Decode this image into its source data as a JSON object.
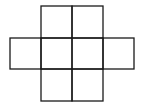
{
  "diagram": {
    "type": "grid-net",
    "stroke_color": "#1a1a1a",
    "background": "#ffffff",
    "cells": [
      {
        "row": 0,
        "col": 1
      },
      {
        "row": 0,
        "col": 2
      },
      {
        "row": 1,
        "col": 0
      },
      {
        "row": 1,
        "col": 1
      },
      {
        "row": 1,
        "col": 2
      },
      {
        "row": 1,
        "col": 3
      },
      {
        "row": 2,
        "col": 1
      },
      {
        "row": 2,
        "col": 2
      }
    ]
  }
}
